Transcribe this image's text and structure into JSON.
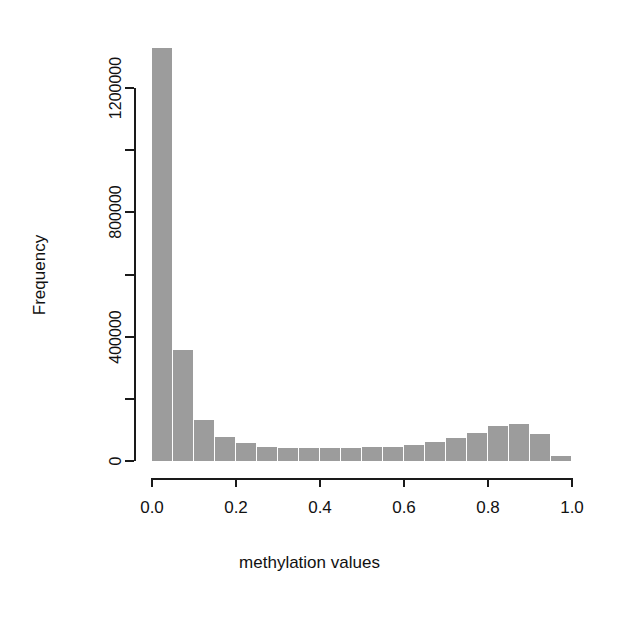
{
  "chart_data": {
    "type": "bar",
    "subtype": "histogram",
    "title": "",
    "xlabel": "methylation values",
    "ylabel": "Frequency",
    "xlim": [
      0.0,
      1.0
    ],
    "ylim": [
      0,
      1200000
    ],
    "grid": false,
    "legend": null,
    "bin_width": 0.05,
    "bar_color": "#9c9c9c",
    "axis_color": "#1a1a1a",
    "background": "#ffffff",
    "xticks": [
      0.0,
      0.2,
      0.4,
      0.6,
      0.8,
      1.0
    ],
    "xtick_labels": [
      "0.0",
      "0.2",
      "0.4",
      "0.6",
      "0.8",
      "1.0"
    ],
    "yticks": [
      0,
      200000,
      400000,
      600000,
      800000,
      1000000,
      1200000
    ],
    "ytick_labels": [
      "0",
      "",
      "400000",
      "",
      "800000",
      "",
      "1200000"
    ],
    "ytick_labeled": [
      true,
      false,
      true,
      false,
      true,
      false,
      true
    ],
    "categories": [
      "0.00-0.05",
      "0.05-0.10",
      "0.10-0.15",
      "0.15-0.20",
      "0.20-0.25",
      "0.25-0.30",
      "0.30-0.35",
      "0.35-0.40",
      "0.40-0.45",
      "0.45-0.50",
      "0.50-0.55",
      "0.55-0.60",
      "0.60-0.65",
      "0.65-0.70",
      "0.70-0.75",
      "0.75-0.80",
      "0.80-0.85",
      "0.85-0.90",
      "0.90-0.95",
      "0.95-1.00"
    ],
    "bin_starts": [
      0.0,
      0.05,
      0.1,
      0.15,
      0.2,
      0.25,
      0.3,
      0.35,
      0.4,
      0.45,
      0.5,
      0.55,
      0.6,
      0.65,
      0.7,
      0.75,
      0.8,
      0.85,
      0.9,
      0.95
    ],
    "bin_ends": [
      0.05,
      0.1,
      0.15,
      0.2,
      0.25,
      0.3,
      0.35,
      0.4,
      0.45,
      0.5,
      0.55,
      0.6,
      0.65,
      0.7,
      0.75,
      0.8,
      0.85,
      0.9,
      0.95,
      1.0
    ],
    "values": [
      1330000,
      357000,
      132000,
      77000,
      58000,
      45000,
      42000,
      41000,
      41000,
      42000,
      44000,
      46000,
      52000,
      61000,
      74000,
      90000,
      112000,
      119000,
      87000,
      16000
    ]
  },
  "axis": {
    "ylabel": "Frequency",
    "xlabel": "methylation values"
  }
}
